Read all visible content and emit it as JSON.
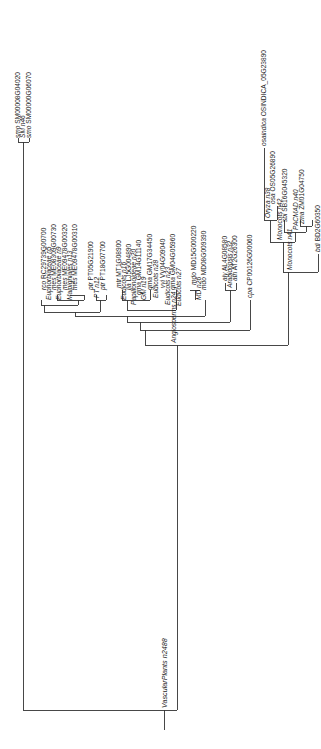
{
  "tree": {
    "orientation": "rotated-90-ccw",
    "line_color": "#333333",
    "root": {
      "label": "VascularPlants n2488"
    },
    "leaves": [
      {
        "id": "smo1",
        "species": "smo",
        "gene": "SM00008G04020"
      },
      {
        "id": "smnode",
        "species": "",
        "gene": "SM n46",
        "node": true
      },
      {
        "id": "smo2",
        "species": "smo",
        "gene": "SM00000G06070"
      },
      {
        "id": "rco",
        "species": "rco",
        "gene": "RC29739G00700"
      },
      {
        "id": "euph1",
        "species": "",
        "gene": "Euphorbiaceae n5",
        "node": true
      },
      {
        "id": "mes1",
        "species": "mes",
        "gene": "ME08309G00730"
      },
      {
        "id": "euph2",
        "species": "",
        "gene": "Euphorbiaceae n9",
        "node": true
      },
      {
        "id": "mes2",
        "species": "mes",
        "gene": "ME09478G00320"
      },
      {
        "id": "malp",
        "species": "",
        "gene": "Malpighiales n13",
        "node": true
      },
      {
        "id": "mes3",
        "species": "mes",
        "gene": "ME09478G00310"
      },
      {
        "id": "ptr1",
        "species": "ptr",
        "gene": "PT05G21900"
      },
      {
        "id": "ptnode",
        "species": "",
        "gene": "PT n12",
        "node": true
      },
      {
        "id": "ptr2",
        "species": "ptr",
        "gene": "PT18G07700"
      },
      {
        "id": "mtr",
        "species": "mtr",
        "gene": "MT1G08900"
      },
      {
        "id": "eud16",
        "species": "",
        "gene": "Eudicots n16",
        "node": true
      },
      {
        "id": "lja",
        "species": "lja",
        "gene": "LJ5G004890"
      },
      {
        "id": "papil",
        "species": "",
        "gene": "Papilionoideae n20",
        "node": true
      },
      {
        "id": "gma1",
        "species": "gma",
        "gene": "GM14G11140"
      },
      {
        "id": "gm19",
        "species": "",
        "gene": "GM n19",
        "node": true
      },
      {
        "id": "gma2",
        "species": "gma",
        "gene": "GM17G34450"
      },
      {
        "id": "eud28",
        "species": "",
        "gene": "Eudicots n28",
        "node": true
      },
      {
        "id": "vvi",
        "species": "vvi",
        "gene": "VV04G09040"
      },
      {
        "id": "eud23",
        "species": "",
        "gene": "Eudicots n23",
        "node": true
      },
      {
        "id": "gma3",
        "species": "gma",
        "gene": "GM04G05960"
      },
      {
        "id": "eud27",
        "species": "",
        "gene": "Eudicots n27",
        "node": true
      },
      {
        "id": "mdo1",
        "species": "mdo",
        "gene": "MD15G000220"
      },
      {
        "id": "md26",
        "species": "",
        "gene": "MD n26",
        "node": true
      },
      {
        "id": "mdo2",
        "species": "mdo",
        "gene": "MD08G009390"
      },
      {
        "id": "aly",
        "species": "aly",
        "gene": "AL4G08580"
      },
      {
        "id": "arab",
        "species": "",
        "gene": "Arabidopsis n32",
        "node": true
      },
      {
        "id": "ath",
        "species": "ath",
        "gene": "AT2G26300"
      },
      {
        "id": "cpa",
        "species": "cpa",
        "gene": "CP00126G00060"
      },
      {
        "id": "angio",
        "species": "",
        "gene": "Angiosperms n24",
        "node": true
      },
      {
        "id": "osa_ind",
        "species": "osaindica",
        "gene": "OSINDICA_05G23890"
      },
      {
        "id": "oryza",
        "species": "",
        "gene": "Oryza n38",
        "node": true
      },
      {
        "id": "osa",
        "species": "osa",
        "gene": "OS05G26890"
      },
      {
        "id": "mono42",
        "species": "",
        "gene": "Monocots n42",
        "node": true
      },
      {
        "id": "sbi",
        "species": "sbi",
        "gene": "SB16G045320"
      },
      {
        "id": "monoN",
        "species": "",
        "gene": "Monocots n41",
        "node": true
      },
      {
        "id": "pacmad",
        "species": "",
        "gene": "PACMAD n40",
        "node": true
      },
      {
        "id": "zma",
        "species": "zma",
        "gene": "ZM01G04750"
      },
      {
        "id": "bdi",
        "species": "bdi",
        "gene": "BD2G60350"
      }
    ]
  }
}
